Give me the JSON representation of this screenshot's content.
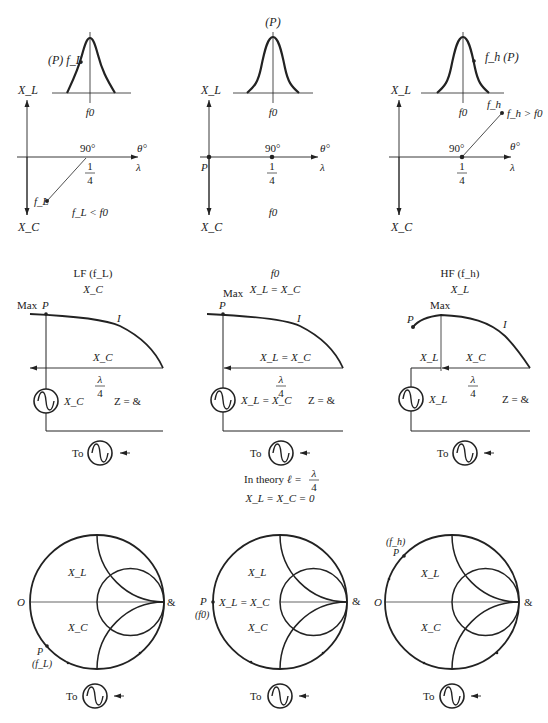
{
  "top_row": {
    "panel_low": {
      "curve_marker": "(P) f_L",
      "f0_label": "f0",
      "axis_up": "X_L",
      "axis_down": "X_C",
      "angle_label": "90°",
      "theta_label": "θ°",
      "lambda_label": "λ",
      "quarter_num": "1",
      "quarter_den": "4",
      "point_label": "f_L",
      "condition": "f_L < f0"
    },
    "panel_center": {
      "curve_marker": "(P)",
      "f0_label": "f0",
      "axis_up": "X_L",
      "axis_down": "X_C",
      "angle_label": "90°",
      "theta_label": "θ°",
      "lambda_label": "λ",
      "quarter_num": "1",
      "quarter_den": "4",
      "point_label": "P",
      "condition": "f0"
    },
    "panel_high": {
      "curve_marker": "f_h (P)",
      "f0_label": "f0",
      "fh_label": "f_h",
      "axis_up": "X_L",
      "axis_down": "X_C",
      "angle_label": "90°",
      "theta_label": "θ°",
      "lambda_label": "λ",
      "quarter_num": "1",
      "quarter_den": "4",
      "condition": "f_h > f0"
    }
  },
  "middle_row": {
    "panel_low": {
      "title": "LF (f_L)",
      "subtitle": "X_C",
      "max_label": "Max",
      "p_label": "P",
      "current_label": "I",
      "line_label": "X_C",
      "lambda_num": "λ",
      "lambda_den": "4",
      "source_label": "X_C",
      "load_label": "Z = &",
      "to_label": "To"
    },
    "panel_center": {
      "title": "f0",
      "subtitle": "X_L = X_C",
      "max_label": "Max",
      "p_label": "P",
      "current_label": "I",
      "line_label": "X_L = X_C",
      "lambda_num": "λ",
      "lambda_den": "4",
      "source_label": "X_L = X_C",
      "load_label": "Z = &",
      "to_label": "To"
    },
    "panel_high": {
      "title": "HF (f_h)",
      "subtitle": "X_L",
      "max_label": "Max",
      "p_label": "P",
      "current_label": "I",
      "line_label_left": "X_L",
      "line_label": "X_C",
      "lambda_num": "λ",
      "lambda_den": "4",
      "source_label": "X_L",
      "load_label": "Z = &",
      "to_label": "To"
    },
    "theory_note": {
      "prefix": "In theory",
      "equation": "ℓ =",
      "frac_num": "λ",
      "frac_den": "4",
      "line2": "X_L = X_C = 0"
    }
  },
  "bottom_row": {
    "smith_low": {
      "left_label": "O",
      "right_label": "&",
      "upper_region": "X_L",
      "lower_region": "X_C",
      "p_label": "P",
      "p_freq": "(f_L)",
      "to_label": "To"
    },
    "smith_center": {
      "left_label": "P",
      "p_freq": "(f0)",
      "right_label": "&",
      "upper_region": "X_L",
      "mid_region": "X_L = X_C",
      "lower_region": "X_C",
      "to_label": "To"
    },
    "smith_high": {
      "left_label": "O",
      "right_label": "&",
      "upper_region": "X_L",
      "lower_region": "X_C",
      "p_label": "P",
      "p_freq": "(f_h)",
      "to_label": "To"
    }
  },
  "colors": {
    "ink": "#222222",
    "background": "#ffffff"
  }
}
